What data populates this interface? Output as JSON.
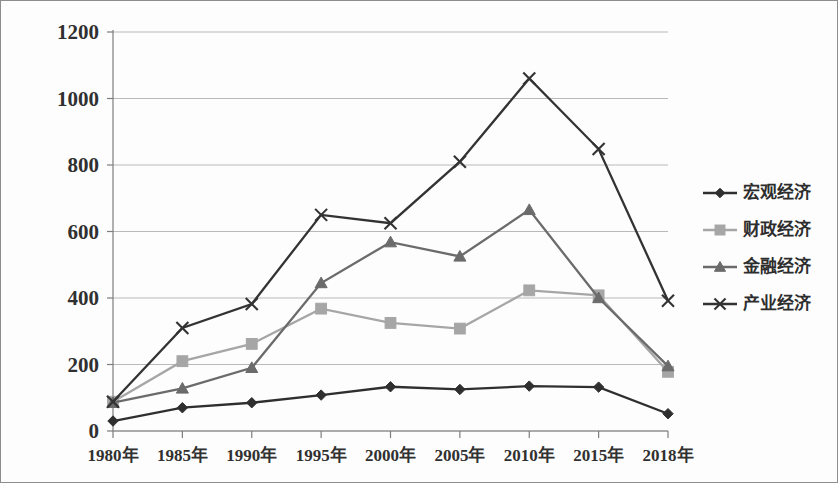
{
  "chart_data": {
    "type": "line",
    "title": "",
    "xlabel": "",
    "ylabel": "",
    "grid": true,
    "legend_position": "right",
    "categories": [
      "1980年",
      "1985年",
      "1990年",
      "1995年",
      "2000年",
      "2005年",
      "2010年",
      "2015年",
      "2018年"
    ],
    "ylim": [
      0,
      1200
    ],
    "yticks": [
      "0",
      "200",
      "400",
      "600",
      "800",
      "1000",
      "1200"
    ],
    "ytick_values": [
      0,
      200,
      400,
      600,
      800,
      1000,
      1200
    ],
    "series": [
      {
        "name": "宏观经济",
        "marker": "diamond",
        "color": "#2f2f2f",
        "values": [
          30,
          70,
          85,
          108,
          133,
          125,
          135,
          132,
          52
        ]
      },
      {
        "name": "财政经济",
        "marker": "square",
        "color": "#a6a6a6",
        "values": [
          88,
          210,
          262,
          368,
          325,
          308,
          423,
          408,
          178
        ]
      },
      {
        "name": "金融经济",
        "marker": "triangle",
        "color": "#6b6b6b",
        "values": [
          85,
          128,
          190,
          445,
          568,
          525,
          665,
          400,
          195
        ]
      },
      {
        "name": "产业经济",
        "marker": "cross",
        "color": "#333333",
        "values": [
          88,
          310,
          382,
          650,
          625,
          810,
          1060,
          848,
          392
        ]
      }
    ]
  },
  "legend": {
    "items": [
      {
        "label": "宏观经济",
        "marker": "diamond"
      },
      {
        "label": "财政经济",
        "marker": "square"
      },
      {
        "label": "金融经济",
        "marker": "triangle"
      },
      {
        "label": "产业经济",
        "marker": "cross"
      }
    ]
  }
}
